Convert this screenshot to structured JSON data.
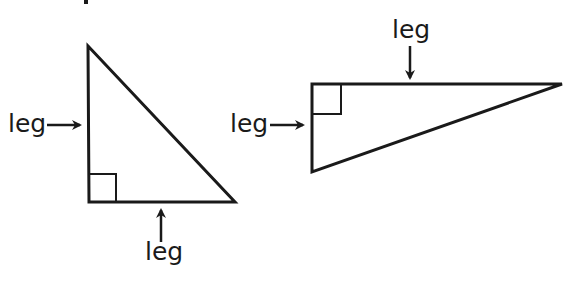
{
  "diagram": {
    "colors": {
      "stroke": "#1a1a1a",
      "background": "#ffffff"
    },
    "triangles": [
      {
        "name": "tall-triangle",
        "labels": {
          "left": "leg",
          "bottom": "leg"
        }
      },
      {
        "name": "wide-triangle",
        "labels": {
          "top": "leg",
          "left": "leg"
        }
      }
    ]
  }
}
